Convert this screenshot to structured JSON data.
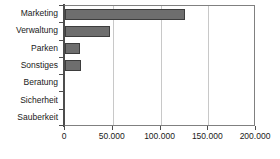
{
  "chart_data": {
    "type": "bar",
    "orientation": "horizontal",
    "title": "",
    "subtitle": "",
    "xlabel": "",
    "ylabel": "",
    "categories": [
      "Marketing",
      "Verwaltung",
      "Parken",
      "Sonstiges",
      "Beratung",
      "Sicherheit",
      "Sauberkeit"
    ],
    "values": [
      125500,
      47000,
      16000,
      16500,
      0,
      0,
      0
    ],
    "series": [
      {
        "name": "",
        "values": [
          125500,
          47000,
          16000,
          16500,
          0,
          0,
          0
        ]
      }
    ],
    "xlim": [
      0,
      200000
    ],
    "ylim": null,
    "xticks": [
      0,
      50000,
      100000,
      150000,
      200000
    ],
    "xtick_labels": [
      "0",
      "50.000",
      "100.000",
      "150.000",
      "200.000"
    ],
    "grid": "vertical",
    "legend": null,
    "legend_position": "none",
    "annotations": [],
    "colors": {
      "bar_fill": "#6e6e6e",
      "bar_border": "#3d3d3d",
      "gridline": "#c8c8c8",
      "axis": "#4d4d4d",
      "frame": "#808080",
      "background": "#ffffff",
      "text": "#1a1a1a"
    }
  }
}
